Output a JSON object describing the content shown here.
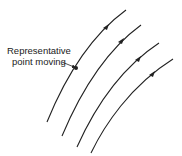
{
  "figure": {
    "label_line1": "Representative",
    "label_line2": "point moving",
    "trajectories": [
      {
        "id": 1,
        "path": "M47,122 C60,90 85,40 126,10",
        "arrow": [
          107,
          27
        ]
      },
      {
        "id": 2,
        "path": "M62,136 C75,105 100,55 141,25",
        "arrow": [
          122,
          41
        ]
      },
      {
        "id": 3,
        "path": "M77,147 C90,118 115,72 159,43",
        "arrow": [
          139,
          59
        ]
      },
      {
        "id": 4,
        "path": "M91,153 C104,126 130,86 173,59",
        "arrow": [
          153,
          74
        ]
      }
    ],
    "point": [
      76,
      68
    ],
    "color": "#222222"
  }
}
